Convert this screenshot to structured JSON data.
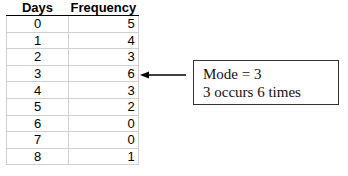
{
  "table": {
    "headers": [
      "Days",
      "Frequency"
    ],
    "rows": [
      {
        "days": "0",
        "frequency": "5"
      },
      {
        "days": "1",
        "frequency": "4"
      },
      {
        "days": "2",
        "frequency": "3"
      },
      {
        "days": "3",
        "frequency": "6"
      },
      {
        "days": "4",
        "frequency": "3"
      },
      {
        "days": "5",
        "frequency": "2"
      },
      {
        "days": "6",
        "frequency": "0"
      },
      {
        "days": "7",
        "frequency": "0"
      },
      {
        "days": "8",
        "frequency": "1"
      }
    ]
  },
  "annotation": {
    "line1": "Mode = 3",
    "line2": "3 occurs 6 times",
    "points_to_row": "3"
  }
}
